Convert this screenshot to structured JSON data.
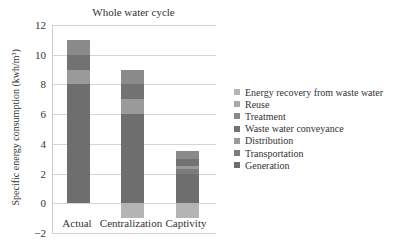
{
  "chart_data": {
    "type": "bar",
    "stacked": true,
    "title": "Whole water cycle",
    "xlabel": "",
    "ylabel": "Specific energy consumption (kwh/m³)",
    "ylim": [
      -2,
      12
    ],
    "yticks": [
      12,
      10,
      8,
      6,
      4,
      2,
      0,
      -2
    ],
    "ytick_labels": [
      "12",
      "10",
      "8",
      "6",
      "4",
      "2",
      "0",
      "−2"
    ],
    "grid": true,
    "legend_position": "right",
    "categories": [
      "Actual",
      "Centralization",
      "Captivity"
    ],
    "series": [
      {
        "name": "Generation",
        "color": "#6e6e6e",
        "values": [
          8,
          6,
          2
        ]
      },
      {
        "name": "Transportation",
        "color": "#7c7c7c",
        "values": [
          0,
          0,
          0.3
        ]
      },
      {
        "name": "Distribution",
        "color": "#9a9a9a",
        "values": [
          1,
          1,
          0.2
        ]
      },
      {
        "name": "Waste water conveyance",
        "color": "#727272",
        "values": [
          1,
          1,
          0.5
        ]
      },
      {
        "name": "Treatment",
        "color": "#8a8a8a",
        "values": [
          1,
          1,
          0.5
        ]
      },
      {
        "name": "Reuse",
        "color": "#a8a8a8",
        "values": [
          0,
          0,
          0
        ]
      },
      {
        "name": "Energy recovery from waste water",
        "color": "#b4b4b4",
        "values": [
          0,
          -1,
          -1
        ]
      }
    ]
  },
  "legend": [
    {
      "label": "Energy recovery from waste water",
      "color": "#b4b4b4"
    },
    {
      "label": "Reuse",
      "color": "#a8a8a8"
    },
    {
      "label": "Treatment",
      "color": "#8a8a8a"
    },
    {
      "label": "Waste water conveyance",
      "color": "#727272"
    },
    {
      "label": "Distribution",
      "color": "#9a9a9a"
    },
    {
      "label": "Transportation",
      "color": "#7c7c7c"
    },
    {
      "label": "Generation",
      "color": "#6e6e6e"
    }
  ]
}
